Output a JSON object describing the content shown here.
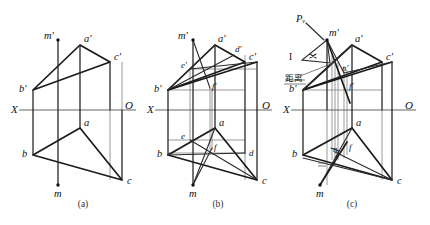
{
  "figure": {
    "background_color": "#ffffff",
    "ink_color": "#1a1a1a",
    "width": 430,
    "height": 225
  },
  "panels": [
    {
      "id": "a",
      "caption": "(a)",
      "caption_pos": {
        "x": 83,
        "y": 207
      },
      "axis": {
        "label_left": "X",
        "label_right": "O",
        "left_label_pos": {
          "x": 11,
          "y": 113
        },
        "right_label_pos": {
          "x": 125,
          "y": 109
        },
        "line": {
          "x1": 19,
          "y1": 110,
          "x2": 136,
          "y2": 110
        }
      },
      "points": [
        {
          "name": "a-prime",
          "label": "a'",
          "x": 80,
          "y": 45,
          "label_dx": 4,
          "label_dy": -3
        },
        {
          "name": "b-prime",
          "label": "b'",
          "x": 33,
          "y": 90,
          "label_dx": -14,
          "label_dy": 2
        },
        {
          "name": "c-prime",
          "label": "c'",
          "x": 110,
          "y": 62,
          "label_dx": 4,
          "label_dy": -2
        },
        {
          "name": "a",
          "label": "a",
          "x": 80,
          "y": 128,
          "label_dx": 4,
          "label_dy": -2
        },
        {
          "name": "b",
          "label": "b",
          "x": 33,
          "y": 155,
          "label_dx": -11,
          "label_dy": 2
        },
        {
          "name": "c",
          "label": "c",
          "x": 122,
          "y": 180,
          "label_dx": 5,
          "label_dy": 4
        },
        {
          "name": "m-prime",
          "label": "m'",
          "x": 58,
          "y": 40,
          "label_dx": -14,
          "label_dy": -1,
          "marker": "dot"
        },
        {
          "name": "m",
          "label": "m",
          "x": 58,
          "y": 185,
          "label_dx": -4,
          "label_dy": 12,
          "marker": "dot"
        }
      ]
    },
    {
      "id": "b",
      "caption": "(b)",
      "caption_pos": {
        "x": 218,
        "y": 207
      },
      "axis": {
        "label_left": "X",
        "label_right": "O",
        "left_label_pos": {
          "x": 147,
          "y": 113
        },
        "right_label_pos": {
          "x": 262,
          "y": 109
        },
        "line": {
          "x1": 155,
          "y1": 110,
          "x2": 272,
          "y2": 110
        }
      },
      "points": [
        {
          "name": "a-prime",
          "label": "a'",
          "x": 215,
          "y": 45,
          "label_dx": 3,
          "label_dy": -3
        },
        {
          "name": "b-prime",
          "label": "b'",
          "x": 168,
          "y": 90,
          "label_dx": -14,
          "label_dy": 2
        },
        {
          "name": "c-prime",
          "label": "c'",
          "x": 245,
          "y": 62,
          "label_dx": 4,
          "label_dy": -2
        },
        {
          "name": "d-prime",
          "label": "d'",
          "x": 234,
          "y": 55,
          "label_dx": 1,
          "label_dy": -3
        },
        {
          "name": "e-prime",
          "label": "e'",
          "x": 190,
          "y": 69,
          "label_dx": -9,
          "label_dy": -1
        },
        {
          "name": "f-prime",
          "label": "f'",
          "x": 210,
          "y": 88,
          "label_dx": 2,
          "label_dy": 1
        },
        {
          "name": "a",
          "label": "a",
          "x": 215,
          "y": 128,
          "label_dx": 4,
          "label_dy": -2
        },
        {
          "name": "b",
          "label": "b",
          "x": 168,
          "y": 155,
          "label_dx": -11,
          "label_dy": 2
        },
        {
          "name": "c",
          "label": "c",
          "x": 257,
          "y": 180,
          "label_dx": 5,
          "label_dy": 4
        },
        {
          "name": "d",
          "label": "d",
          "x": 245,
          "y": 153,
          "label_dx": 4,
          "label_dy": 3
        },
        {
          "name": "e",
          "label": "e",
          "x": 190,
          "y": 140,
          "label_dx": -9,
          "label_dy": -1
        },
        {
          "name": "f",
          "label": "f",
          "x": 212,
          "y": 148,
          "label_dx": 2,
          "label_dy": 2
        },
        {
          "name": "m-prime",
          "label": "m'",
          "x": 193,
          "y": 40,
          "label_dx": -15,
          "label_dy": -1,
          "marker": "dot"
        },
        {
          "name": "m",
          "label": "m",
          "x": 193,
          "y": 185,
          "label_dx": -4,
          "label_dy": 12,
          "marker": "dot"
        }
      ]
    },
    {
      "id": "c",
      "caption": "(c)",
      "caption_pos": {
        "x": 352,
        "y": 207
      },
      "axis": {
        "label_left": "X",
        "label_right": "O",
        "left_label_pos": {
          "x": 283,
          "y": 113
        },
        "right_label_pos": {
          "x": 405,
          "y": 109
        },
        "line": {
          "x1": 291,
          "y1": 110,
          "x2": 416,
          "y2": 110
        }
      },
      "annotations": [
        {
          "name": "pv-label",
          "text": "Pᵥ",
          "x": 300,
          "y": 20
        },
        {
          "name": "roman-one",
          "text": "I",
          "x": 291,
          "y": 58
        },
        {
          "name": "distance-label",
          "text": "距离",
          "x": 287,
          "y": 78
        }
      ],
      "points": [
        {
          "name": "a-prime",
          "label": "a'",
          "x": 352,
          "y": 45,
          "label_dx": 3,
          "label_dy": -3
        },
        {
          "name": "b-prime",
          "label": "b'",
          "x": 303,
          "y": 90,
          "label_dx": -14,
          "label_dy": 2
        },
        {
          "name": "c-prime",
          "label": "c'",
          "x": 382,
          "y": 62,
          "label_dx": 4,
          "label_dy": -2
        },
        {
          "name": "n-prime",
          "label": "n'",
          "x": 344,
          "y": 73,
          "label_dx": -2,
          "label_dy": -2
        },
        {
          "name": "f-prime",
          "label": "f'",
          "x": 347,
          "y": 88,
          "label_dx": 2,
          "label_dy": 1
        },
        {
          "name": "m-prime",
          "label": "m'",
          "x": 327,
          "y": 40,
          "label_dx": 2,
          "label_dy": -4,
          "marker": "dot"
        },
        {
          "name": "a",
          "label": "a",
          "x": 352,
          "y": 128,
          "label_dx": 4,
          "label_dy": -2
        },
        {
          "name": "b",
          "label": "b",
          "x": 303,
          "y": 155,
          "label_dx": -11,
          "label_dy": 2
        },
        {
          "name": "c",
          "label": "c",
          "x": 392,
          "y": 180,
          "label_dx": 5,
          "label_dy": 4
        },
        {
          "name": "n",
          "label": "n",
          "x": 335,
          "y": 152,
          "label_dx": -2,
          "label_dy": 0
        },
        {
          "name": "f",
          "label": "f",
          "x": 347,
          "y": 148,
          "label_dx": 2,
          "label_dy": 2
        },
        {
          "name": "m",
          "label": "m",
          "x": 320,
          "y": 185,
          "label_dx": -4,
          "label_dy": 12,
          "marker": "dot"
        }
      ]
    }
  ],
  "legend": {
    "heavy_line": "triangle / visible outline",
    "thin_line": "projection connector",
    "medium_line": "auxiliary construction line"
  }
}
